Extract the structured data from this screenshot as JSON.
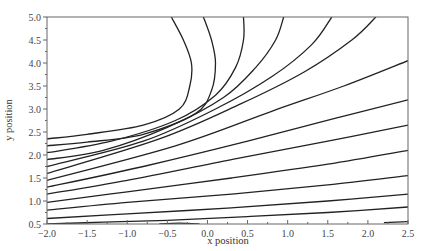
{
  "chart_data": {
    "type": "line",
    "subtype": "contour",
    "title": "",
    "xlabel": "x position",
    "ylabel": "y position",
    "xlim": [
      -2.0,
      2.5
    ],
    "ylim": [
      0.5,
      5.0
    ],
    "grid": false,
    "legend": null,
    "x_ticks": [
      -2.0,
      -1.5,
      -1.0,
      -0.5,
      0.0,
      0.5,
      1.0,
      1.5,
      2.0,
      2.5
    ],
    "x_tick_labels": [
      "-2.0",
      "-1.5",
      "-1.0",
      "-0.5",
      "0.0",
      "0.5",
      "1.0",
      "1.5",
      "2.0",
      "2.5"
    ],
    "y_ticks": [
      0.5,
      1.0,
      1.5,
      2.0,
      2.5,
      3.0,
      3.5,
      4.0,
      4.5,
      5.0
    ],
    "y_tick_labels": [
      "0.5",
      "1.0",
      "1.5",
      "2.0",
      "2.5",
      "3.0",
      "3.5",
      "4.0",
      "4.5",
      "5.0"
    ],
    "line_color": "#222222",
    "series": [
      {
        "name": "contour-1",
        "points": [
          [
            -0.45,
            5.0
          ],
          [
            -0.3,
            4.5
          ],
          [
            -0.2,
            4.0
          ],
          [
            -0.22,
            3.5
          ],
          [
            -0.35,
            3.0
          ],
          [
            -0.8,
            2.65
          ],
          [
            -1.5,
            2.45
          ],
          [
            -2.0,
            2.35
          ]
        ]
      },
      {
        "name": "contour-2",
        "points": [
          [
            -0.05,
            5.0
          ],
          [
            0.05,
            4.5
          ],
          [
            0.1,
            4.0
          ],
          [
            0.05,
            3.4
          ],
          [
            -0.15,
            2.9
          ],
          [
            -0.8,
            2.45
          ],
          [
            -1.5,
            2.28
          ],
          [
            -2.0,
            2.2
          ]
        ]
      },
      {
        "name": "contour-3",
        "points": [
          [
            0.45,
            5.0
          ],
          [
            0.45,
            4.5
          ],
          [
            0.35,
            3.9
          ],
          [
            0.1,
            3.3
          ],
          [
            -0.4,
            2.75
          ],
          [
            -1.2,
            2.3
          ],
          [
            -2.0,
            2.05
          ]
        ]
      },
      {
        "name": "contour-4",
        "points": [
          [
            0.95,
            5.0
          ],
          [
            0.85,
            4.5
          ],
          [
            0.6,
            3.9
          ],
          [
            0.2,
            3.25
          ],
          [
            -0.5,
            2.6
          ],
          [
            -1.3,
            2.1
          ],
          [
            -2.0,
            1.9
          ]
        ]
      },
      {
        "name": "contour-5",
        "points": [
          [
            1.55,
            5.0
          ],
          [
            1.3,
            4.4
          ],
          [
            0.8,
            3.7
          ],
          [
            0.1,
            3.0
          ],
          [
            -0.8,
            2.3
          ],
          [
            -2.0,
            1.75
          ]
        ]
      },
      {
        "name": "contour-6",
        "points": [
          [
            2.1,
            5.0
          ],
          [
            1.8,
            4.5
          ],
          [
            1.2,
            3.8
          ],
          [
            0.4,
            3.1
          ],
          [
            -0.6,
            2.35
          ],
          [
            -2.0,
            1.6
          ]
        ]
      },
      {
        "name": "contour-7",
        "points": [
          [
            2.5,
            4.05
          ],
          [
            1.7,
            3.5
          ],
          [
            0.8,
            2.95
          ],
          [
            -0.4,
            2.2
          ],
          [
            -2.0,
            1.45
          ]
        ]
      },
      {
        "name": "contour-8",
        "points": [
          [
            2.5,
            3.2
          ],
          [
            1.6,
            2.8
          ],
          [
            0.5,
            2.3
          ],
          [
            -0.8,
            1.75
          ],
          [
            -2.0,
            1.3
          ]
        ]
      },
      {
        "name": "contour-9",
        "points": [
          [
            2.5,
            2.65
          ],
          [
            1.5,
            2.3
          ],
          [
            0.3,
            1.9
          ],
          [
            -1.0,
            1.45
          ],
          [
            -2.0,
            1.15
          ]
        ]
      },
      {
        "name": "contour-10",
        "points": [
          [
            2.5,
            2.1
          ],
          [
            1.5,
            1.8
          ],
          [
            0.3,
            1.5
          ],
          [
            -1.0,
            1.2
          ],
          [
            -2.0,
            0.97
          ]
        ]
      },
      {
        "name": "contour-11",
        "points": [
          [
            2.5,
            1.55
          ],
          [
            1.5,
            1.35
          ],
          [
            0.3,
            1.15
          ],
          [
            -1.0,
            0.97
          ],
          [
            -2.0,
            0.8
          ]
        ]
      },
      {
        "name": "contour-12",
        "points": [
          [
            2.5,
            1.15
          ],
          [
            1.5,
            1.0
          ],
          [
            0.3,
            0.85
          ],
          [
            -1.0,
            0.72
          ],
          [
            -2.0,
            0.62
          ]
        ]
      },
      {
        "name": "contour-13",
        "points": [
          [
            2.5,
            0.87
          ],
          [
            1.5,
            0.75
          ],
          [
            0.5,
            0.66
          ],
          [
            -0.5,
            0.58
          ],
          [
            -1.3,
            0.54
          ],
          [
            -2.0,
            0.5
          ]
        ]
      },
      {
        "name": "contour-14",
        "points": [
          [
            2.5,
            0.55
          ],
          [
            2.2,
            0.53
          ]
        ]
      },
      {
        "name": "contour-15",
        "points": [
          [
            -0.6,
            0.5
          ],
          [
            -0.35,
            0.52
          ],
          [
            -0.1,
            0.5
          ]
        ]
      }
    ]
  }
}
